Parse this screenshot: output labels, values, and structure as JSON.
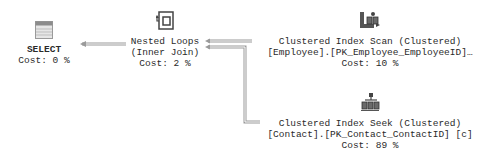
{
  "plan": {
    "nodes": [
      {
        "id": "select",
        "title": "SELECT",
        "cost": "Cost: 0 %",
        "icon": "select-result-icon"
      },
      {
        "id": "nested-loops",
        "title": "Nested Loops",
        "subtitle": "(Inner Join)",
        "cost": "Cost: 2 %",
        "icon": "nested-loops-icon"
      },
      {
        "id": "clustered-index-scan",
        "title": "Clustered Index Scan (Clustered)",
        "object": "[Employee].[PK_Employee_EmployeeID]…",
        "cost": "Cost: 10 %",
        "icon": "clustered-index-scan-icon"
      },
      {
        "id": "clustered-index-seek",
        "title": "Clustered Index Seek (Clustered)",
        "object": "[Contact].[PK_Contact_ContactID] [c]",
        "cost": "Cost: 89 %",
        "icon": "clustered-index-seek-icon"
      }
    ],
    "colors": {
      "arrow": "#8a8a8a",
      "text": "#2a2a2a",
      "background": "#ffffff"
    }
  }
}
